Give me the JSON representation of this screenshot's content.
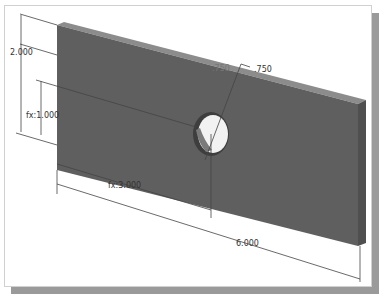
{
  "drawing": {
    "part": "rectangular plate with hole",
    "colors": {
      "plate_face": "#5f5f5f",
      "plate_top_edge": "#8c8c8c",
      "plate_side_edge": "#4a4a4a",
      "hole_interior": "#f2f2f2",
      "dimension_line": "#444444",
      "frame_shadow": "#9a9a9a"
    },
    "dimensions": {
      "height": "2.000",
      "hole_vertical": "fx:1.000",
      "hole_horizontal": "fx:3.000",
      "length": "6.000",
      "hole_diameter": ".750",
      "hole_diameter_ghost": ".750"
    }
  }
}
